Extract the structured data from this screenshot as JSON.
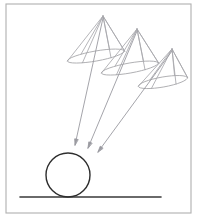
{
  "diagram": {
    "background_color": "#ffffff",
    "frame": {
      "label": "drawing frame border",
      "x": 6,
      "y": 4,
      "width": 185,
      "height": 209,
      "stroke_color": "#b0b0b0",
      "stroke_width": 1.1,
      "fill": "none"
    },
    "ground_line": {
      "label": "ground line",
      "x1": 20,
      "y1": 197,
      "x2": 161,
      "y2": 197,
      "stroke_color": "#3a3a3a",
      "stroke_width": 1.6
    },
    "ball": {
      "label": "ball resting on ground",
      "center_x": 68,
      "center_y": 175,
      "radius": 22,
      "stroke_color": "#2e2e2e",
      "stroke_width": 1.4,
      "fill": "none"
    },
    "cones": {
      "label": "three light cones",
      "stroke_color": "#a8a8ac",
      "stroke_width": 0.85,
      "items": [
        {
          "name": "cone-left",
          "apex_x": 103,
          "apex_y": 16,
          "base_center_x": 96,
          "base_center_y": 56,
          "base_rx": 29,
          "base_ry": 5,
          "base_rotation": -10
        },
        {
          "name": "cone-middle",
          "apex_x": 137,
          "apex_y": 29,
          "base_center_x": 130,
          "base_center_y": 68,
          "base_rx": 29,
          "base_ry": 5,
          "base_rotation": -10
        },
        {
          "name": "cone-right",
          "apex_x": 172,
          "apex_y": 49,
          "base_center_x": 163,
          "base_center_y": 82,
          "base_rx": 25,
          "base_ry": 5,
          "base_rotation": -10
        }
      ]
    },
    "rays": {
      "label": "three incident rays aimed at the ball",
      "stroke_color": "#9a9aa0",
      "stroke_width": 0.9,
      "arrow_head_length": 6,
      "arrow_head_width": 3.2,
      "items": [
        {
          "name": "ray-left",
          "x1": 103,
          "y1": 18,
          "x2": 75,
          "y2": 145
        },
        {
          "name": "ray-middle",
          "x1": 137,
          "y1": 31,
          "x2": 88,
          "y2": 148
        },
        {
          "name": "ray-right",
          "x1": 172,
          "y1": 51,
          "x2": 98,
          "y2": 152
        }
      ]
    }
  }
}
